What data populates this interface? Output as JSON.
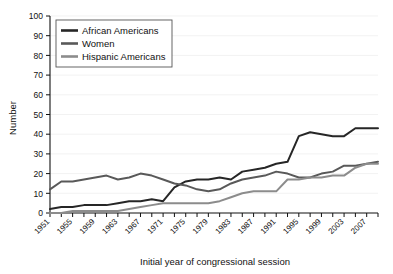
{
  "chart_data": {
    "type": "line",
    "title": "",
    "xlabel": "Initial year of congressional session",
    "ylabel": "Number",
    "xlim": [
      1951,
      2009
    ],
    "ylim": [
      0,
      100
    ],
    "ytick_step": 10,
    "yticks": [
      0,
      10,
      20,
      30,
      40,
      50,
      60,
      70,
      80,
      90,
      100
    ],
    "xticks": [
      1951,
      1953,
      1955,
      1957,
      1959,
      1961,
      1963,
      1965,
      1967,
      1969,
      1971,
      1973,
      1975,
      1977,
      1979,
      1981,
      1983,
      1985,
      1987,
      1989,
      1991,
      1993,
      1995,
      1997,
      1999,
      2001,
      2003,
      2005,
      2007,
      2009
    ],
    "xtick_labels": [
      "1951",
      "1955",
      "1959",
      "1963",
      "1967",
      "1971",
      "1975",
      "1979",
      "1983",
      "1987",
      "1991",
      "1995",
      "1999",
      "2003",
      "2007"
    ],
    "xtick_labeled_values": [
      1951,
      1955,
      1959,
      1963,
      1967,
      1971,
      1975,
      1979,
      1983,
      1987,
      1991,
      1995,
      1999,
      2003,
      2007
    ],
    "grid": true,
    "grid_axis": "y",
    "legend_position": "top-left",
    "x": [
      1951,
      1953,
      1955,
      1957,
      1959,
      1961,
      1963,
      1965,
      1967,
      1969,
      1971,
      1973,
      1975,
      1977,
      1979,
      1981,
      1983,
      1985,
      1987,
      1989,
      1991,
      1993,
      1995,
      1997,
      1999,
      2001,
      2003,
      2005,
      2007,
      2009
    ],
    "series": [
      {
        "name": "African Americans",
        "color": "#262626",
        "values": [
          2,
          3,
          3,
          4,
          4,
          4,
          5,
          6,
          6,
          7,
          6,
          13,
          16,
          17,
          17,
          18,
          17,
          21,
          22,
          23,
          25,
          26,
          39,
          41,
          40,
          39,
          39,
          43,
          43,
          43
        ]
      },
      {
        "name": "Women",
        "color": "#595959",
        "values": [
          12,
          16,
          16,
          17,
          18,
          19,
          17,
          18,
          20,
          19,
          17,
          15,
          14,
          12,
          11,
          12,
          15,
          17,
          18,
          19,
          21,
          20,
          18,
          18,
          20,
          21,
          24,
          24,
          25,
          26
        ]
      },
      {
        "name": "Hispanic Americans",
        "color": "#8c8c8c",
        "values": [
          0,
          0,
          1,
          1,
          1,
          1,
          1,
          2,
          3,
          4,
          5,
          5,
          5,
          5,
          5,
          6,
          8,
          10,
          11,
          11,
          11,
          17,
          17,
          18,
          18,
          19,
          19,
          23,
          25,
          25
        ]
      }
    ],
    "series_true_values": {
      "African Americans": {
        "1951": 2,
        "1953": 3,
        "1955": 3,
        "1957": 4,
        "1959": 4,
        "1961": 4,
        "1963": 5,
        "1965": 6,
        "1967": 6,
        "1969": 7,
        "1971": 6,
        "1973": 13,
        "1975": 16,
        "1977": 17,
        "1979": 17,
        "1981": 18,
        "1983": 17,
        "1985": 21,
        "1987": 22,
        "1989": 23,
        "1991": 25,
        "1993": 26,
        "1995": 39,
        "1997": 41,
        "1999": 40,
        "2001": 39,
        "2003": 39,
        "2005": 43,
        "2007": 43,
        "2009": 43
      },
      "Women": {
        "1951": 12,
        "1953": 16,
        "1955": 16,
        "1957": 17,
        "1959": 18,
        "1961": 19,
        "1963": 17,
        "1965": 18,
        "1967": 20,
        "1969": 19,
        "1971": 17,
        "1973": 15,
        "1975": 14,
        "1977": 12,
        "1979": 11,
        "1981": 12,
        "1983": 15,
        "1985": 17,
        "1987": 18,
        "1989": 19,
        "1991": 21,
        "1993": 20,
        "1995": 18,
        "1997": 18,
        "1999": 20,
        "2001": 21,
        "2003": 24,
        "2005": 24,
        "2007": 25,
        "2009": 26
      },
      "Hispanic Americans": {
        "1951": 0,
        "1953": 0,
        "1955": 1,
        "1957": 1,
        "1959": 1,
        "1961": 1,
        "1963": 1,
        "1965": 2,
        "1967": 3,
        "1969": 4,
        "1971": 5,
        "1973": 5,
        "1975": 5,
        "1977": 5,
        "1979": 5,
        "1981": 6,
        "1983": 8,
        "1985": 10,
        "1987": 11,
        "1989": 11,
        "1991": 11,
        "1993": 17,
        "1995": 17,
        "1997": 18,
        "1999": 18,
        "2001": 19,
        "2003": 19,
        "2005": 23,
        "2007": 25,
        "2009": 25
      }
    },
    "legend": [
      {
        "label": "African Americans",
        "color": "#262626"
      },
      {
        "label": "Women",
        "color": "#595959"
      },
      {
        "label": "Hispanic Americans",
        "color": "#8c8c8c"
      }
    ]
  },
  "axes": {
    "y_title": "Number",
    "x_title": "Initial year of congressional session"
  },
  "colors": {
    "african_americans": "#262626",
    "women": "#595959",
    "hispanic_americans": "#8c8c8c",
    "grid": "#ededed",
    "axis": "#111111",
    "background": "#ffffff"
  }
}
